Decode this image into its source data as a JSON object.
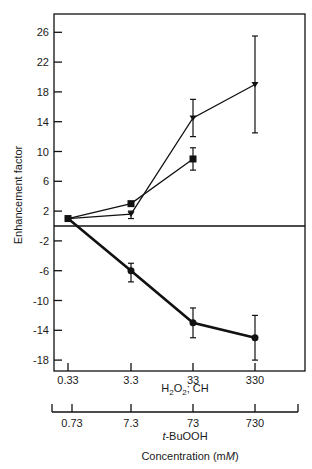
{
  "chart_data": {
    "type": "line",
    "title": "",
    "ylabel": "Enhancement factor",
    "xlabel": "Concentration (mM)",
    "x_axis_primary": {
      "label": "H2O2; CH",
      "ticks": [
        "0.33",
        "3.3",
        "33",
        "330"
      ],
      "scale": "log"
    },
    "x_axis_secondary": {
      "label": "t-BuOOH",
      "ticks": [
        "0.73",
        "7.3",
        "73",
        "730"
      ],
      "scale": "log"
    },
    "y_ticks_upper": [
      26,
      22,
      18,
      14,
      10,
      6,
      2
    ],
    "y_ticks_lower": [
      -2,
      -6,
      -10,
      -14,
      -18
    ],
    "ylim": [
      -19,
      28
    ],
    "grid": false,
    "categories": [
      "0.33",
      "3.3",
      "33",
      "330"
    ],
    "series": [
      {
        "name": "triangle",
        "marker": "triangle-down",
        "values": [
          1.0,
          1.6,
          14.5,
          19.0
        ],
        "error_low": [
          null,
          1.0,
          12.0,
          12.5
        ],
        "error_high": [
          null,
          2.0,
          17.0,
          25.5
        ]
      },
      {
        "name": "square",
        "marker": "square",
        "values": [
          1.0,
          3.0,
          9.0,
          null
        ],
        "error_low": [
          null,
          null,
          7.5,
          null
        ],
        "error_high": [
          null,
          null,
          10.5,
          null
        ]
      },
      {
        "name": "circle",
        "marker": "circle",
        "values": [
          1.0,
          -6.0,
          -13.0,
          -15.0
        ],
        "error_low": [
          null,
          -7.5,
          -15.0,
          -18.0
        ],
        "error_high": [
          null,
          -5.0,
          -11.0,
          -12.0
        ]
      }
    ]
  },
  "labels": {
    "ylabel": "Enhancement factor",
    "x_primary_label_main": "H",
    "x_primary_sub1": "2",
    "x_primary_mid": "O",
    "x_primary_sub2": "2",
    "x_primary_rest": "; CH",
    "x_secondary_italic": "t",
    "x_secondary_rest": "-BuOOH",
    "xlabel_main": "Concentration (m",
    "xlabel_italic": "M",
    "xlabel_end": ")"
  }
}
